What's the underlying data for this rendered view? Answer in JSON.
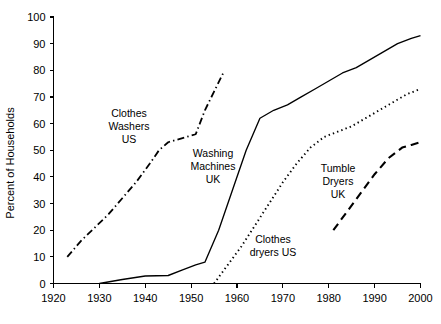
{
  "chart_data": {
    "type": "line",
    "title": "",
    "xlabel": "",
    "ylabel": "Percent of Households",
    "xlim": [
      1920,
      2000
    ],
    "ylim": [
      0,
      100
    ],
    "xticks": [
      1920,
      1930,
      1940,
      1950,
      1960,
      1970,
      1980,
      1990,
      2000
    ],
    "yticks": [
      0,
      10,
      20,
      30,
      40,
      50,
      60,
      70,
      80,
      90,
      100
    ],
    "xtick_labels": [
      "1920",
      "1930",
      "1940",
      "1950",
      "1960",
      "1970",
      "1980",
      "1990",
      "2000"
    ],
    "ytick_labels": [
      "0",
      "10",
      "20",
      "30",
      "40",
      "50",
      "60",
      "70",
      "80",
      "90",
      "100"
    ],
    "grid": false,
    "legend": "inline-annotations",
    "series": [
      {
        "name": "Clothes Washers US",
        "label_lines": [
          "Clothes",
          "Washers",
          "US"
        ],
        "line_style": "dash-dot",
        "color": "#000000",
        "x": [
          1923,
          1926,
          1929,
          1932,
          1935,
          1938,
          1941,
          1943,
          1945,
          1947,
          1949,
          1951,
          1953,
          1955,
          1957
        ],
        "y": [
          10,
          16,
          21,
          26,
          32,
          38,
          45,
          50,
          53,
          54,
          55,
          56,
          65,
          72,
          79
        ]
      },
      {
        "name": "Washing Machines UK",
        "label_lines": [
          "Washing",
          "Machines",
          "UK"
        ],
        "line_style": "solid",
        "color": "#000000",
        "x": [
          1930,
          1935,
          1940,
          1945,
          1948,
          1951,
          1953,
          1956,
          1959,
          1962,
          1965,
          1968,
          1971,
          1974,
          1977,
          1980,
          1983,
          1986,
          1989,
          1992,
          1995,
          1998,
          2000
        ],
        "y": [
          0,
          1.5,
          2.8,
          3,
          5,
          7,
          8,
          20,
          35,
          50,
          62,
          65,
          67,
          70,
          73,
          76,
          79,
          81,
          84,
          87,
          90,
          92,
          93
        ]
      },
      {
        "name": "Clothes dryers US",
        "label_lines": [
          "Clothes",
          "dryers US"
        ],
        "line_style": "dotted",
        "color": "#000000",
        "x": [
          1955,
          1958,
          1961,
          1964,
          1967,
          1970,
          1973,
          1976,
          1979,
          1982,
          1985,
          1988,
          1991,
          1994,
          1997,
          2000
        ],
        "y": [
          0,
          7,
          14,
          22,
          30,
          38,
          45,
          51,
          55,
          57,
          59,
          62,
          65,
          68,
          71,
          73
        ]
      },
      {
        "name": "Tumble Dryers UK",
        "label_lines": [
          "Tumble",
          "Dryers",
          "UK"
        ],
        "line_style": "dashed",
        "color": "#000000",
        "x": [
          1981,
          1984,
          1987,
          1990,
          1993,
          1996,
          1998,
          2000
        ],
        "y": [
          20,
          27,
          34,
          41,
          47,
          51,
          52,
          53
        ]
      }
    ],
    "annotations": [
      {
        "id": "clothes-washers-us",
        "text": "Clothes Washers US",
        "x_px": 129,
        "y_px": 117
      },
      {
        "id": "washing-machines-uk",
        "text": "Washing Machines UK",
        "x_px": 213,
        "y_px": 157
      },
      {
        "id": "clothes-dryers-us",
        "text": "Clothes dryers US",
        "x_px": 273,
        "y_px": 243
      },
      {
        "id": "tumble-dryers-uk",
        "text": "Tumble Dryers UK",
        "x_px": 338,
        "y_px": 172
      }
    ]
  }
}
